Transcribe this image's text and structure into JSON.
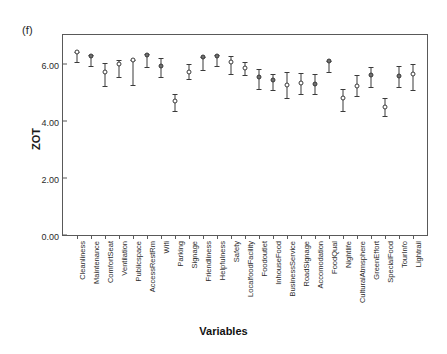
{
  "figure": {
    "panel_label": "(f)",
    "xlabel": "Variables",
    "ylabel": "ZOT"
  },
  "chart_data": {
    "type": "scatter",
    "title": "",
    "subtitle": "",
    "panel": "(f)",
    "xlabel": "Variables",
    "ylabel": "ZOT",
    "ylim": [
      0.0,
      7.0
    ],
    "yticks": [
      "0.00",
      "2.00",
      "4.00",
      "6.00"
    ],
    "ytick_values": [
      0.0,
      2.0,
      4.0,
      6.0
    ],
    "grid": false,
    "legend": "none",
    "annotation": "Mean ZOT with error bars (95% CI) for 26 service attribute variables",
    "categories": [
      "Cleanliness",
      "Maintenance",
      "ComfortSeat",
      "Ventilation",
      "Publicspace",
      "AccessRestRm",
      "Wifi",
      "Parking",
      "Signage",
      "Friendliness",
      "Helpfulness",
      "Safety",
      "LocalfoodFacility",
      "Foodoutlet",
      "InhouseFood",
      "BusinessService",
      "RoadSignage",
      "Accomodation",
      "FoodQual",
      "Nightlife",
      "CulturalAtmsphere",
      "GreenEffort",
      "SpecialFood",
      "TourInfo",
      "Lightrail"
    ],
    "values": [
      6.4,
      6.28,
      5.7,
      5.97,
      6.12,
      6.3,
      5.93,
      4.68,
      5.72,
      6.22,
      6.28,
      6.05,
      5.85,
      5.52,
      5.42,
      5.24,
      5.33,
      5.3,
      6.08,
      4.8,
      5.23,
      5.6,
      4.47,
      5.58,
      5.63
    ],
    "ci_low": [
      6.05,
      5.92,
      5.22,
      5.52,
      5.25,
      5.88,
      5.52,
      4.33,
      5.45,
      5.78,
      5.9,
      5.62,
      5.6,
      5.12,
      5.08,
      4.78,
      4.95,
      4.93,
      5.72,
      4.35,
      4.88,
      5.18,
      4.18,
      5.18,
      5.08
    ],
    "ci_high": [
      6.42,
      6.3,
      6.02,
      6.12,
      6.14,
      6.32,
      6.18,
      4.95,
      5.98,
      6.24,
      6.3,
      6.28,
      6.05,
      5.8,
      5.62,
      5.72,
      5.68,
      5.62,
      6.1,
      5.12,
      5.6,
      5.88,
      4.78,
      5.9,
      6.0
    ],
    "marker_filled": [
      false,
      true,
      false,
      false,
      false,
      true,
      true,
      false,
      false,
      true,
      true,
      false,
      false,
      true,
      true,
      false,
      false,
      true,
      true,
      false,
      false,
      true,
      false,
      true,
      false
    ]
  }
}
